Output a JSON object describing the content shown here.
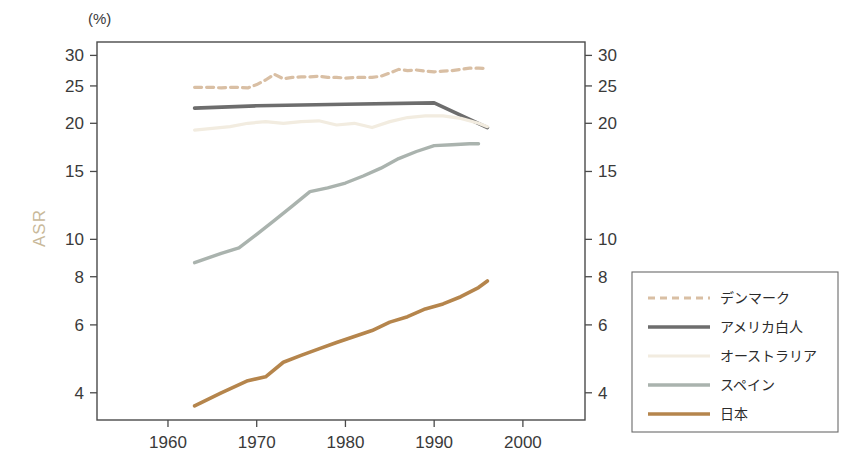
{
  "chart_data": {
    "type": "line",
    "title": "",
    "xlabel": "",
    "ylabel": "ASR",
    "unit_label": "(%)",
    "yscale": "log",
    "ylim": [
      3.4,
      32.5
    ],
    "xlim": [
      1952,
      2007
    ],
    "grid": false,
    "legend_position": "right-outside",
    "x_ticks": [
      1960,
      1970,
      1980,
      1990,
      2000
    ],
    "x_tick_labels": [
      "1960",
      "1970",
      "1980",
      "1990",
      "2000"
    ],
    "y_ticks": [
      4,
      6,
      8,
      10,
      15,
      20,
      25,
      30
    ],
    "y_tick_labels": [
      "4",
      "6",
      "8",
      "10",
      "15",
      "20",
      "25",
      "30"
    ],
    "y_axis_both_sides": true,
    "series": [
      {
        "name": "デンマーク",
        "color": "#d9bfa4",
        "dash": "7,5",
        "width": 3.2,
        "x": [
          1963,
          1964,
          1965,
          1966,
          1967,
          1968,
          1969,
          1970,
          1971,
          1972,
          1973,
          1974,
          1975,
          1976,
          1977,
          1978,
          1979,
          1980,
          1981,
          1982,
          1983,
          1984,
          1985,
          1986,
          1987,
          1988,
          1989,
          1990,
          1991,
          1992,
          1993,
          1994,
          1995,
          1996
        ],
        "values": [
          24.8,
          24.8,
          24.8,
          24.7,
          24.8,
          24.8,
          24.7,
          25.2,
          25.9,
          26.8,
          26.1,
          26.3,
          26.4,
          26.4,
          26.5,
          26.3,
          26.3,
          26.2,
          26.3,
          26.3,
          26.3,
          26.5,
          27.0,
          27.6,
          27.4,
          27.5,
          27.3,
          27.2,
          27.3,
          27.4,
          27.6,
          27.8,
          27.8,
          27.7
        ]
      },
      {
        "name": "アメリカ白人",
        "color": "#6d6d6d",
        "dash": "none",
        "width": 3.6,
        "x": [
          1963,
          1970,
          1980,
          1990,
          1996
        ],
        "values": [
          21.9,
          22.2,
          22.4,
          22.6,
          19.5
        ]
      },
      {
        "name": "オーストラリア",
        "color": "#f2ece0",
        "dash": "none",
        "width": 3.2,
        "x": [
          1963,
          1965,
          1967,
          1969,
          1971,
          1973,
          1975,
          1977,
          1979,
          1981,
          1983,
          1985,
          1987,
          1989,
          1991,
          1993,
          1995,
          1996
        ],
        "values": [
          19.2,
          19.4,
          19.6,
          20.0,
          20.2,
          20.0,
          20.2,
          20.3,
          19.8,
          20.0,
          19.5,
          20.2,
          20.7,
          20.9,
          20.9,
          20.6,
          20.0,
          19.6
        ]
      },
      {
        "name": "スペイン",
        "color": "#aab3ae",
        "dash": "none",
        "width": 3.4,
        "x": [
          1963,
          1966,
          1968,
          1970,
          1972,
          1974,
          1976,
          1978,
          1980,
          1982,
          1984,
          1986,
          1988,
          1990,
          1992,
          1994,
          1995
        ],
        "values": [
          8.7,
          9.2,
          9.5,
          10.3,
          11.2,
          12.2,
          13.3,
          13.6,
          14.0,
          14.6,
          15.3,
          16.2,
          16.9,
          17.5,
          17.6,
          17.7,
          17.7
        ]
      },
      {
        "name": "日本",
        "color": "#b5854c",
        "dash": "none",
        "width": 3.6,
        "x": [
          1963,
          1966,
          1969,
          1971,
          1973,
          1975,
          1977,
          1979,
          1981,
          1983,
          1985,
          1987,
          1989,
          1991,
          1993,
          1995,
          1996
        ],
        "values": [
          3.7,
          4.0,
          4.3,
          4.4,
          4.8,
          5.0,
          5.2,
          5.4,
          5.6,
          5.8,
          6.1,
          6.3,
          6.6,
          6.8,
          7.1,
          7.5,
          7.8
        ]
      }
    ]
  },
  "legend": {
    "items": [
      {
        "label": "デンマーク"
      },
      {
        "label": "アメリカ白人"
      },
      {
        "label": "オーストラリア"
      },
      {
        "label": "スペイン"
      },
      {
        "label": "日本"
      }
    ]
  }
}
